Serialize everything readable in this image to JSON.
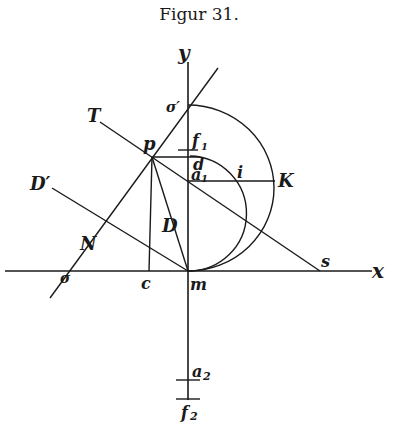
{
  "title": "Figur 31.",
  "labels": {
    "y": "y",
    "x": "x",
    "sigma_prime": "σ′",
    "sigma": "σ",
    "T": "T",
    "p": "p",
    "f1": "f",
    "f1_sub": "1",
    "d": "d",
    "a1": "a",
    "a1_sub": "1",
    "i": "i",
    "K": "K",
    "D_prime": "D′",
    "D": "D",
    "N": "N",
    "c": "c",
    "m": "m",
    "s": "s",
    "a2": "a",
    "a2_sub": "2",
    "f2": "f",
    "f2_sub": "2"
  }
}
